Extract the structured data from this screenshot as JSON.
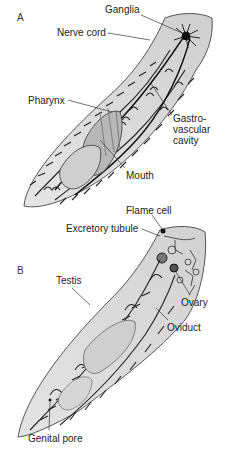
{
  "figure": {
    "panels": [
      {
        "id": "A",
        "label": "A",
        "annotations": [
          {
            "key": "ganglia",
            "text": "Ganglia"
          },
          {
            "key": "nerve_cord",
            "text": "Nerve cord"
          },
          {
            "key": "pharynx",
            "text": "Pharynx"
          },
          {
            "key": "gastrovascular",
            "text": "Gastro-\nvascular\ncavity"
          },
          {
            "key": "mouth",
            "text": "Mouth"
          }
        ]
      },
      {
        "id": "B",
        "label": "B",
        "annotations": [
          {
            "key": "flame_cell",
            "text": "Flame cell"
          },
          {
            "key": "excretory_tubule",
            "text": "Excretory tubule"
          },
          {
            "key": "testis",
            "text": "Testis"
          },
          {
            "key": "ovary",
            "text": "Ovary"
          },
          {
            "key": "oviduct",
            "text": "Oviduct"
          },
          {
            "key": "genital_pore",
            "text": "Genital pore"
          }
        ]
      }
    ]
  },
  "colors": {
    "body_fill": "#dcdcdc",
    "body_outline": "#555555",
    "branch": "#222222",
    "pharynx_fill": "#b8b8b8",
    "leader": "#333333"
  }
}
